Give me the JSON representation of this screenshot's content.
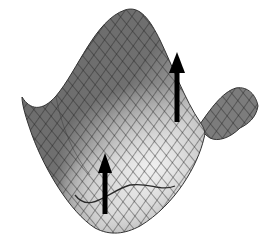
{
  "figure": {
    "colors": {
      "background": "#ffffff",
      "surface_dark": "#5a5a5a",
      "surface_mid": "#7a7a7a",
      "surface_light": "#d8d8d8",
      "mesh_line": "#2a2a2a",
      "arrow": "#000000"
    },
    "arrows": [
      {
        "name": "tall-arrow",
        "x": 177,
        "y_base": 120,
        "y_tip": 52
      },
      {
        "name": "short-arrow",
        "x": 105,
        "y_base": 212,
        "y_tip": 153
      }
    ]
  }
}
